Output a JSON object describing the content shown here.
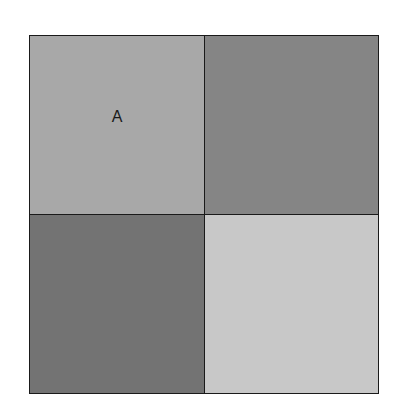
{
  "diagram": {
    "type": "2x2 grid",
    "cells": [
      {
        "position": "top-left",
        "label": "A",
        "color": "#a8a8a8"
      },
      {
        "position": "top-right",
        "label": "",
        "color": "#858585"
      },
      {
        "position": "bottom-left",
        "label": "",
        "color": "#737373"
      },
      {
        "position": "bottom-right",
        "label": "",
        "color": "#c8c8c8"
      }
    ],
    "border_color": "#1a1a1a"
  }
}
